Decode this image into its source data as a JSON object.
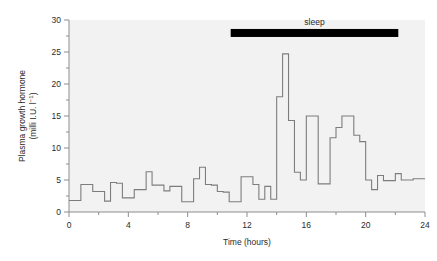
{
  "figure": {
    "background_color": "#ffffff",
    "plot_background_color": "#f2f2f2",
    "axis_color": "#8d8d8d",
    "trace_color": "#7d7d7d",
    "annotation_color": "#000000"
  },
  "labels": {
    "ylabel_line1": "Plasma growth hormone",
    "ylabel_line2_pre": "(milli I.U. l",
    "ylabel_line2_sup": "−1",
    "ylabel_line2_post": ")",
    "xlabel": "Time (hours)",
    "sleep_label": "sleep"
  },
  "chart_data": {
    "type": "line",
    "title": "",
    "xlabel": "Time (hours)",
    "ylabel": "Plasma growth hormone (milli I.U. l−1)",
    "xlim": [
      0,
      24
    ],
    "ylim": [
      0,
      30
    ],
    "xticks": [
      0,
      4,
      8,
      12,
      16,
      20,
      24
    ],
    "xticks_minor": [
      2,
      6,
      10,
      14,
      18,
      22
    ],
    "yticks": [
      0,
      5,
      10,
      15,
      20,
      25,
      30
    ],
    "yticks_minor": [
      2.5,
      7.5,
      12.5,
      17.5,
      22.5,
      27.5
    ],
    "grid": false,
    "legend": "none",
    "drawstyle": "steps-post",
    "x": [
      0.0,
      0.4,
      0.8,
      1.2,
      1.6,
      2.0,
      2.4,
      2.8,
      3.2,
      3.6,
      4.0,
      4.4,
      4.8,
      5.2,
      5.6,
      6.0,
      6.4,
      6.8,
      7.2,
      7.6,
      8.0,
      8.4,
      8.8,
      9.2,
      9.6,
      10.0,
      10.4,
      10.8,
      11.2,
      11.6,
      12.0,
      12.4,
      12.8,
      13.2,
      13.6,
      14.0,
      14.4,
      14.8,
      15.2,
      15.6,
      16.0,
      16.4,
      16.8,
      17.2,
      17.6,
      18.0,
      18.4,
      18.8,
      19.2,
      19.6,
      20.0,
      20.4,
      20.8,
      21.2,
      21.6,
      22.0,
      22.4,
      22.8,
      23.2,
      23.6,
      24.0
    ],
    "values": [
      1.8,
      1.8,
      4.3,
      4.3,
      3.2,
      3.2,
      1.7,
      4.6,
      4.5,
      2.2,
      2.2,
      3.5,
      3.5,
      6.3,
      4.2,
      4.2,
      3.3,
      4.0,
      4.0,
      1.6,
      1.6,
      5.2,
      7.0,
      4.3,
      4.2,
      3.2,
      3.1,
      1.6,
      1.6,
      5.5,
      5.5,
      4.3,
      2.0,
      4.0,
      2.0,
      18.0,
      24.7,
      14.3,
      6.2,
      5.0,
      15.0,
      15.0,
      4.4,
      4.4,
      11.6,
      13.2,
      15.0,
      15.0,
      12.0,
      11.0,
      5.0,
      3.5,
      5.7,
      4.9,
      4.9,
      6.0,
      5.0,
      5.0,
      5.2,
      5.2,
      5.2
    ],
    "annotations": [
      {
        "type": "bar",
        "label": "sleep",
        "x_start": 10.9,
        "x_end": 22.2,
        "y_value": 28.6,
        "color": "#000000"
      }
    ]
  }
}
